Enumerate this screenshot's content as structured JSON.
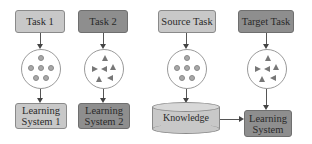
{
  "diagram": {
    "left_panel": {
      "task1": {
        "label": "Task 1",
        "shape": "circle-dots"
      },
      "task2": {
        "label": "Task 2",
        "shape": "triangles"
      },
      "learning_system_1": {
        "label": "Learning System 1",
        "line1": "Learning",
        "line2": "System 1"
      },
      "learning_system_2": {
        "label": "Learning System 2",
        "line1": "Learning",
        "line2": "System 2"
      }
    },
    "right_panel": {
      "source_task": {
        "label": "Source Task"
      },
      "target_task": {
        "label": "Target Task"
      },
      "knowledge": {
        "label": "Knowledge"
      },
      "learning_system": {
        "label": "Learning System",
        "line1": "Learning",
        "line2": "System"
      }
    },
    "colors": {
      "light_box": "#c8c8c8",
      "dark_box": "#8e8e8e",
      "border": "#8a8a8a",
      "arrow": "#444444"
    }
  }
}
